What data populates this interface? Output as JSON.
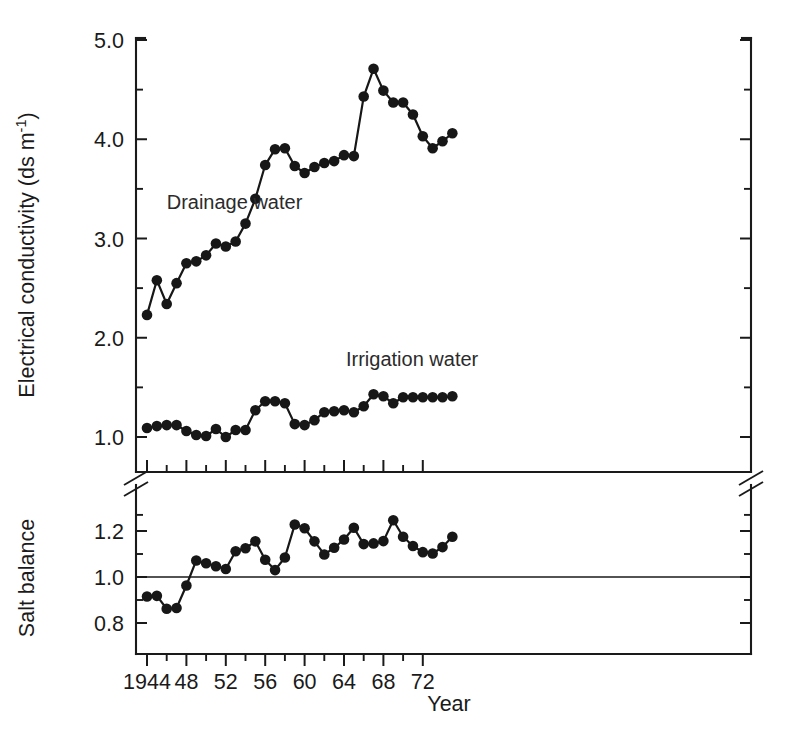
{
  "figure": {
    "name": "electrical-conductivity-salt-balance-figure",
    "background": "#ffffff",
    "ink_color": "#171717"
  },
  "chart_data": {
    "type": "line",
    "title": "",
    "xlabel": "Year",
    "grid": false,
    "legend": "inline-annotations",
    "panels": [
      {
        "id": "upper",
        "ylabel": "Electrical conductivity (ds m",
        "ylabel_super": "-1",
        "ylabel_suffix": ")",
        "ylabel_full": "Electrical conductivity (ds m-1)",
        "ylim": [
          0.6,
          5.05
        ],
        "yticks": [
          1.0,
          2.0,
          3.0,
          4.0,
          5.0
        ],
        "ytick_labels": [
          "1.0",
          "2.0",
          "3.0",
          "4.0",
          "5.0"
        ],
        "yminor": [
          1.5,
          2.5,
          3.5,
          4.5
        ],
        "xlim": [
          1943.4,
          1973.6
        ],
        "series": [
          {
            "name": "Drainage water",
            "label": "Drainage water",
            "label_x": 1946.0,
            "label_y": 3.3,
            "x": [
              1944,
              1945,
              1946,
              1947,
              1948,
              1949,
              1950,
              1951,
              1952,
              1953,
              1954,
              1955,
              1956,
              1957,
              1958,
              1959,
              1960,
              1961,
              1962,
              1963,
              1964,
              1965,
              1966,
              1967,
              1968,
              1969,
              1970,
              1971,
              1972,
              1973
            ],
            "values": [
              2.23,
              2.58,
              2.34,
              2.55,
              2.75,
              2.77,
              2.83,
              2.95,
              2.92,
              2.97,
              3.15,
              3.4,
              3.74,
              3.9,
              3.91,
              3.73,
              3.66,
              3.72,
              3.76,
              3.78,
              3.84,
              3.83,
              4.43,
              4.71,
              4.49,
              4.37,
              4.37,
              4.25,
              4.03,
              3.91,
              3.98,
              4.06
            ]
          },
          {
            "name": "Irrigation water",
            "label": "Irrigation water",
            "label_x": 1964.2,
            "label_y": 1.72,
            "x": [
              1944,
              1945,
              1946,
              1947,
              1948,
              1949,
              1950,
              1951,
              1952,
              1953,
              1954,
              1955,
              1956,
              1957,
              1958,
              1959,
              1960,
              1961,
              1962,
              1963,
              1964,
              1965,
              1966,
              1967,
              1968,
              1969,
              1970,
              1971,
              1972,
              1973
            ],
            "values": [
              1.09,
              1.11,
              1.12,
              1.12,
              1.06,
              1.02,
              1.01,
              1.08,
              1.0,
              1.07,
              1.07,
              1.27,
              1.36,
              1.36,
              1.34,
              1.13,
              1.12,
              1.17,
              1.25,
              1.26,
              1.27,
              1.25,
              1.31,
              1.43,
              1.41,
              1.34,
              1.4,
              1.4,
              1.4,
              1.4,
              1.4,
              1.41
            ]
          }
        ]
      },
      {
        "id": "lower",
        "ylabel": "Salt balance",
        "ylim": [
          0.73,
          1.3
        ],
        "yticks": [
          0.8,
          1.0,
          1.2
        ],
        "ytick_labels": [
          "0.8",
          "1.0",
          "1.2"
        ],
        "yminor": [
          0.9,
          1.1,
          1.27
        ],
        "reference_line": 1.0,
        "xlim": [
          1943.4,
          1973.6
        ],
        "series": [
          {
            "name": "Salt balance",
            "label": "",
            "x": [
              1944,
              1945,
              1946,
              1947,
              1948,
              1949,
              1950,
              1951,
              1952,
              1953,
              1954,
              1955,
              1956,
              1957,
              1958,
              1959,
              1960,
              1961,
              1962,
              1963,
              1964,
              1965,
              1966,
              1967,
              1968,
              1969,
              1970,
              1971,
              1972,
              1973
            ],
            "values": [
              0.915,
              0.918,
              0.862,
              0.865,
              0.963,
              1.072,
              1.06,
              1.047,
              1.035,
              1.112,
              1.125,
              1.155,
              1.075,
              1.03,
              1.085,
              1.228,
              1.212,
              1.155,
              1.098,
              1.127,
              1.163,
              1.214,
              1.143,
              1.146,
              1.156,
              1.247,
              1.175,
              1.135,
              1.108,
              1.102,
              1.13,
              1.175
            ]
          }
        ]
      }
    ],
    "xticks": [
      1944,
      1948,
      1952,
      1956,
      1960,
      1964,
      1968,
      1972
    ],
    "xtick_labels": [
      "1944",
      "48",
      "52",
      "56",
      "60",
      "64",
      "68",
      "72"
    ],
    "xminor": [
      1946,
      1950,
      1954,
      1958,
      1962,
      1966,
      1970
    ],
    "axis_break": true,
    "axis_break_note": "broken y-axis between upper and lower panels"
  }
}
